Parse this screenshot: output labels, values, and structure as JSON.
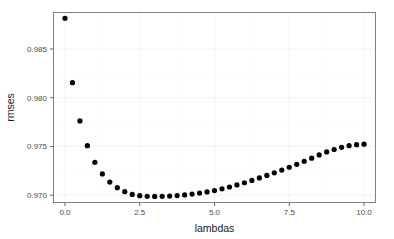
{
  "chart_data": {
    "type": "scatter",
    "title": "",
    "subtitle": "",
    "xlabel": "lambdas",
    "ylabel": "rmses",
    "xlim": [
      -0.4,
      10.4
    ],
    "ylim": [
      0.9692,
      0.9888
    ],
    "xticks": [
      0.0,
      2.5,
      5.0,
      7.5,
      10.0
    ],
    "xtick_labels": [
      "0.0",
      "2.5",
      "5.0",
      "7.5",
      "10.0"
    ],
    "yticks": [
      0.97,
      0.975,
      0.98,
      0.985
    ],
    "ytick_labels": [
      "0.970",
      "0.975",
      "0.980",
      "0.985"
    ],
    "grid": true,
    "legend": "none",
    "point_color": "#000000",
    "panel_background": "#ffffff",
    "panel_border_color": "#808080",
    "grid_color": "#f2f2f2",
    "x": [
      0.0,
      0.25,
      0.5,
      0.75,
      1.0,
      1.25,
      1.5,
      1.75,
      2.0,
      2.25,
      2.5,
      2.75,
      3.0,
      3.25,
      3.5,
      3.75,
      4.0,
      4.25,
      4.5,
      4.75,
      5.0,
      5.25,
      5.5,
      5.75,
      6.0,
      6.25,
      6.5,
      6.75,
      7.0,
      7.25,
      7.5,
      7.75,
      8.0,
      8.25,
      8.5,
      8.75,
      9.0,
      9.25,
      9.5,
      9.75,
      10.0
    ],
    "y": [
      0.98815,
      0.98155,
      0.97762,
      0.97508,
      0.97337,
      0.97218,
      0.97135,
      0.97077,
      0.97036,
      0.97008,
      0.96995,
      0.96989,
      0.96987,
      0.96988,
      0.96991,
      0.96996,
      0.97003,
      0.97012,
      0.97022,
      0.97034,
      0.97048,
      0.97065,
      0.97084,
      0.97105,
      0.97128,
      0.97152,
      0.97177,
      0.97203,
      0.9723,
      0.97258,
      0.97287,
      0.97317,
      0.97348,
      0.9738,
      0.97413,
      0.97444,
      0.97469,
      0.97491,
      0.97508,
      0.97519,
      0.97524
    ],
    "series": [
      {
        "name": "rmses",
        "marker": "filled-circle",
        "marker_size": 2.6,
        "color": "#000000"
      }
    ],
    "n_points": 41,
    "x_step": 0.25,
    "minimum": {
      "x": 3.0,
      "y": 0.96987
    }
  }
}
